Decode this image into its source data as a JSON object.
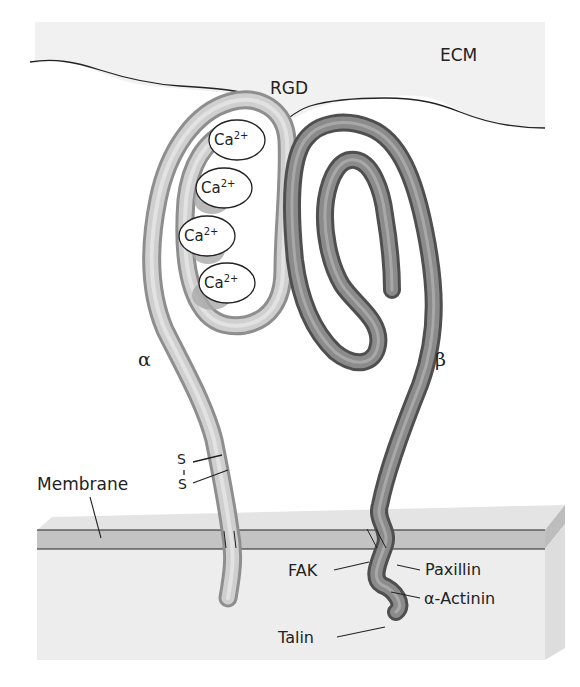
{
  "diagram": {
    "regions": {
      "ecm": "ECM",
      "membrane": "Membrane"
    },
    "binding_motif": "RGD",
    "subunits": {
      "alpha": "α",
      "beta": "β"
    },
    "calcium_sites": [
      {
        "base": "Ca",
        "charge": "2+"
      },
      {
        "base": "Ca",
        "charge": "2+"
      },
      {
        "base": "Ca",
        "charge": "2+"
      },
      {
        "base": "Ca",
        "charge": "2+"
      }
    ],
    "disulfide": {
      "s1": "S",
      "s2": "S"
    },
    "cytoplasmic_partners": {
      "fak": "FAK",
      "paxillin": "Paxillin",
      "actinin": "α-Actinin",
      "talin": "Talin"
    },
    "colors": {
      "alpha_chain": "#b9b9b9",
      "beta_chain": "#7a7a7a",
      "ecm_bg": "#f2f2f2",
      "membrane_band": "#c4c4c4",
      "cytoplasm_block": "#ececec",
      "outline": "#222222"
    }
  }
}
